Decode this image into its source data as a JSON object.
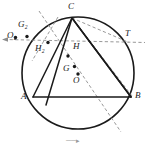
{
  "figure": {
    "width": 151,
    "height": 150,
    "background": "#ffffff",
    "stroke_solid": "#1a1a1a",
    "stroke_dashed": "#8c8c8c",
    "point_fill": "#1a1a1a",
    "caption": "──▸"
  },
  "circle": {
    "name": "circumcircle",
    "cx": 78,
    "cy": 73,
    "r": 56,
    "stroke": "#1a1a1a",
    "stroke_width": 1.5
  },
  "points": [
    {
      "id": "A",
      "label": "A",
      "x": 33,
      "y": 97,
      "label_x": 22,
      "label_y": 98,
      "dot": false
    },
    {
      "id": "B",
      "label": "B",
      "x": 131,
      "y": 97,
      "label_x": 134,
      "label_y": 96,
      "dot": false
    },
    {
      "id": "C",
      "label": "C",
      "x": 72,
      "y": 18,
      "label_x": 68,
      "label_y": 3,
      "dot": false
    },
    {
      "id": "T",
      "label": "T",
      "x": 128,
      "y": 43,
      "label_x": 126,
      "label_y": 31,
      "dot": false
    },
    {
      "id": "H",
      "label": "H",
      "x": 68,
      "y": 56,
      "label_x": 73,
      "label_y": 44,
      "dot": true
    },
    {
      "id": "H2",
      "label": "H₂",
      "x": 48,
      "y": 43,
      "label_x": 36,
      "label_y": 45,
      "dot": true
    },
    {
      "id": "G",
      "label": "G",
      "x": 75,
      "y": 67,
      "label_x": 64,
      "label_y": 68,
      "dot": true
    },
    {
      "id": "O",
      "label": "O",
      "x": 78,
      "y": 74,
      "label_x": 74,
      "label_y": 80,
      "dot": true
    },
    {
      "id": "G2",
      "label": "G₂",
      "x": 27,
      "y": 36,
      "label_x": 19,
      "label_y": 23,
      "dot": true
    },
    {
      "id": "O2",
      "label": "O₂",
      "x": 15,
      "y": 37,
      "label_x": 8,
      "label_y": 33,
      "dot": true
    }
  ],
  "solid_segments": [
    {
      "name": "chord-AB",
      "from": "A",
      "to": "B"
    },
    {
      "name": "side-AC",
      "from": "A",
      "to": "C"
    },
    {
      "name": "side-CB",
      "from": "C",
      "to": "B"
    },
    {
      "name": "cevian-C-to-A-side",
      "x1": 72,
      "y1": 18,
      "x2": 46,
      "y2": 104
    },
    {
      "name": "cevian-C-to-B-side",
      "x1": 72,
      "y1": 18,
      "x2": 131,
      "y2": 97
    }
  ],
  "dashed_segments": [
    {
      "name": "line-H2-through-H-to-T",
      "x1": 4,
      "y1": 39,
      "x2": 144,
      "y2": 42
    },
    {
      "name": "chord-C-to-T",
      "x1": 72,
      "y1": 18,
      "x2": 129,
      "y2": 43
    },
    {
      "name": "ray-C-to-lower-right",
      "x1": 72,
      "y1": 18,
      "x2": 131,
      "y2": 97
    },
    {
      "name": "euler-line",
      "x1": 39,
      "y1": 12,
      "x2": 120,
      "y2": 131
    },
    {
      "name": "altitude-through-H2",
      "x1": 57,
      "y1": 18,
      "x2": 33,
      "y2": 60
    }
  ],
  "arrow": {
    "name": "left-arrow-head",
    "x": 3,
    "y": 39,
    "direction": "left"
  }
}
